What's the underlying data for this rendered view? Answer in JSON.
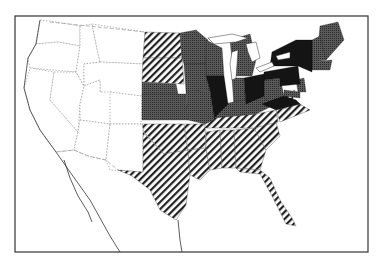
{
  "map": {
    "region": "United States",
    "style": "choropleth, black-and-white",
    "classes": [
      {
        "id": "none",
        "fill": "white",
        "description": "unshaded"
      },
      {
        "id": "hatch",
        "fill": "diagonal hatch",
        "description": "light diagonal hatching"
      },
      {
        "id": "medium",
        "fill": "#4a4a4a",
        "description": "dark grey stipple"
      },
      {
        "id": "dark",
        "fill": "#151515",
        "description": "near black"
      }
    ],
    "states": {
      "hatch": [
        "ND",
        "SD",
        "NE",
        "OK",
        "TX",
        "AR",
        "LA",
        "MS",
        "AL",
        "GA",
        "FL",
        "SC",
        "TN",
        "NC",
        "DE"
      ],
      "medium": [
        "MN",
        "WI",
        "MI",
        "IA",
        "KS",
        "MO",
        "IN",
        "KY",
        "WV",
        "VT",
        "NH",
        "ME",
        "MA",
        "CT",
        "RI",
        "NJ",
        "MD"
      ],
      "dark": [
        "IL",
        "OH",
        "PA",
        "NY",
        "VA"
      ],
      "none": [
        "WA",
        "OR",
        "CA",
        "ID",
        "NV",
        "MT",
        "WY",
        "UT",
        "AZ",
        "CO",
        "NM"
      ]
    }
  }
}
